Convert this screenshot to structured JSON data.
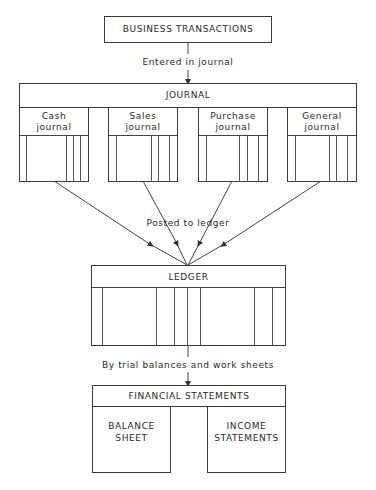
{
  "diagram": {
    "top": {
      "label": "BUSINESS TRANSACTIONS"
    },
    "step1": {
      "label": "Entered in journal"
    },
    "journal": {
      "title": "JOURNAL",
      "subs": [
        {
          "line1": "Cash",
          "line2": "journal"
        },
        {
          "line1": "Sales",
          "line2": "journal"
        },
        {
          "line1": "Purchase",
          "line2": "journal"
        },
        {
          "line1": "General",
          "line2": "journal"
        }
      ]
    },
    "step2": {
      "label": "Posted to ledger"
    },
    "ledger": {
      "title": "LEDGER"
    },
    "step3": {
      "label": "By trial balances and work sheets"
    },
    "financial": {
      "title": "FINANCIAL STATEMENTS",
      "balance": {
        "line1": "BALANCE",
        "line2": "SHEET"
      },
      "income": {
        "line1": "INCOME",
        "line2": "STATEMENTS"
      }
    }
  }
}
